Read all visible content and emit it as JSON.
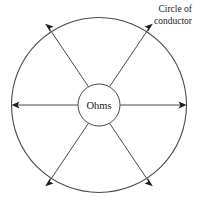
{
  "figure": {
    "title_label": {
      "line1": "Circle of",
      "line2": "conductor"
    },
    "center_label": "Ohms",
    "colors": {
      "stroke": "#4a4a4a",
      "arrow": "#1d1d1d",
      "text": "#1a1a1a",
      "background": "#ffffff"
    },
    "geometry": {
      "center_x": 99,
      "center_y": 105,
      "outer_radius": 88,
      "inner_radius": 21,
      "spoke_angles_deg": [
        0,
        60,
        120,
        180,
        240,
        300
      ],
      "spoke_count": 6
    }
  }
}
